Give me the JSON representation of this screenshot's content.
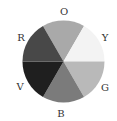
{
  "diagram": {
    "type": "color-wheel",
    "center": [
      63.5,
      61.5
    ],
    "radius": 41,
    "segments": [
      {
        "label": "O",
        "name": "orange",
        "start_deg": 240,
        "end_deg": 300,
        "fill": "#a9a9a9",
        "label_pos": [
          64,
          12
        ]
      },
      {
        "label": "Y",
        "name": "yellow",
        "start_deg": 300,
        "end_deg": 360,
        "fill": "#f3f3f3",
        "label_pos": [
          105,
          38
        ]
      },
      {
        "label": "G",
        "name": "green",
        "start_deg": 0,
        "end_deg": 60,
        "fill": "#b9b9b9",
        "label_pos": [
          105,
          88
        ]
      },
      {
        "label": "B",
        "name": "blue",
        "start_deg": 60,
        "end_deg": 120,
        "fill": "#7b7b7b",
        "label_pos": [
          61,
          114
        ]
      },
      {
        "label": "V",
        "name": "violet",
        "start_deg": 120,
        "end_deg": 180,
        "fill": "#1f1f1f",
        "label_pos": [
          20,
          87
        ]
      },
      {
        "label": "R",
        "name": "red",
        "start_deg": 180,
        "end_deg": 240,
        "fill": "#484848",
        "label_pos": [
          21,
          38
        ]
      }
    ]
  }
}
